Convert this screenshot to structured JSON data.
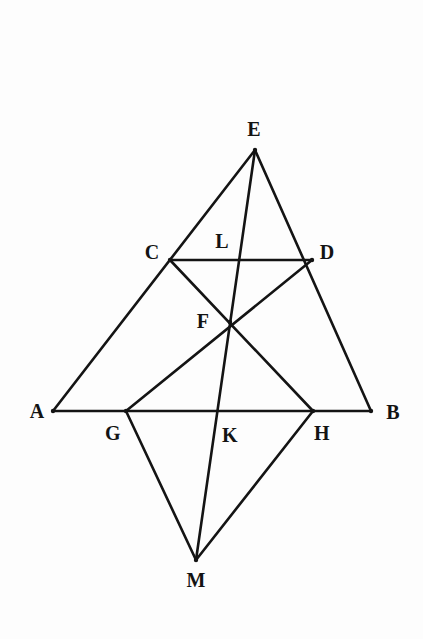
{
  "figure": {
    "background_color": "#fdfdfd",
    "stroke_color": "#141414",
    "label_color": "#131313",
    "width": 423,
    "height": 639
  },
  "points": {
    "A": {
      "label": "A",
      "x": 53,
      "y": 411,
      "label_x": 37,
      "label_y": 411
    },
    "B": {
      "label": "B",
      "x": 371,
      "y": 411,
      "label_x": 393,
      "label_y": 412
    },
    "C": {
      "label": "C",
      "x": 170,
      "y": 260,
      "label_x": 152,
      "label_y": 252
    },
    "D": {
      "label": "D",
      "x": 312,
      "y": 260,
      "label_x": 327,
      "label_y": 252
    },
    "E": {
      "label": "E",
      "x": 255,
      "y": 150,
      "label_x": 254,
      "label_y": 129
    },
    "F": {
      "label": "F",
      "x": 230,
      "y": 322,
      "label_x": 203,
      "label_y": 321
    },
    "G": {
      "label": "G",
      "x": 126,
      "y": 411,
      "label_x": 113,
      "label_y": 433
    },
    "H": {
      "label": "H",
      "x": 313,
      "y": 411,
      "label_x": 322,
      "label_y": 433
    },
    "K": {
      "label": "K",
      "x": 215,
      "y": 411,
      "label_x": 230,
      "label_y": 435
    },
    "L": {
      "label": "L",
      "x": 240,
      "y": 260,
      "label_x": 222,
      "label_y": 241
    },
    "M": {
      "label": "M",
      "x": 196,
      "y": 560,
      "label_x": 196,
      "label_y": 580
    }
  },
  "segments": [
    {
      "name": "segment-AE",
      "from": "A",
      "to": "E"
    },
    {
      "name": "segment-BE",
      "from": "B",
      "to": "E"
    },
    {
      "name": "segment-AB",
      "from": "A",
      "to": "B"
    },
    {
      "name": "segment-CD",
      "from": "C",
      "to": "D"
    },
    {
      "name": "segment-EM",
      "from": "E",
      "to": "M"
    },
    {
      "name": "segment-CH",
      "from": "C",
      "to": "H"
    },
    {
      "name": "segment-DG",
      "from": "D",
      "to": "G"
    },
    {
      "name": "segment-GM",
      "from": "G",
      "to": "M"
    },
    {
      "name": "segment-HM",
      "from": "H",
      "to": "M"
    }
  ],
  "vertex_dots": [
    "E",
    "C",
    "D",
    "F",
    "G",
    "H",
    "M",
    "A",
    "B"
  ]
}
